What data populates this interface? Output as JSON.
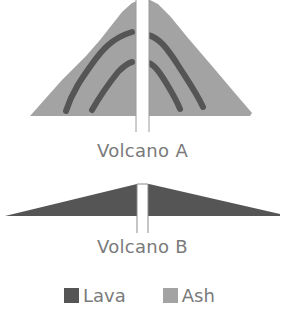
{
  "diagram": {
    "volcano_a": {
      "label": "Volcano A",
      "description": "Steep composite cone of ash with interbedded lava layers and a central vent"
    },
    "volcano_b": {
      "label": "Volcano B",
      "description": "Broad, low shield cone built of lava with a central vent"
    },
    "legend": [
      {
        "key": "lava",
        "label": "Lava",
        "color": "#555555"
      },
      {
        "key": "ash",
        "label": "Ash",
        "color": "#a3a3a3"
      }
    ]
  },
  "colors": {
    "ash": "#a3a3a3",
    "lava": "#555555",
    "vent": "#ffffff",
    "text": "#7a7a7a"
  }
}
